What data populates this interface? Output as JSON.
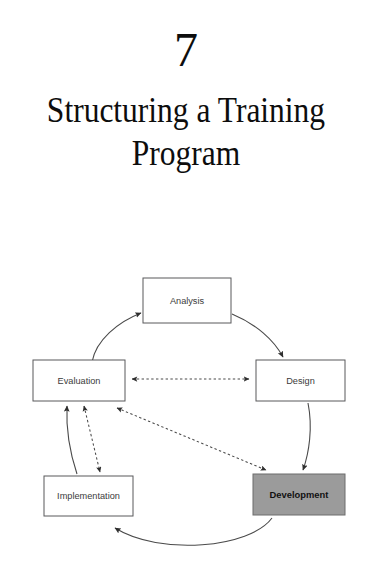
{
  "page": {
    "background_color": "#ffffff",
    "width": 372,
    "height": 566
  },
  "chapter": {
    "number": "7",
    "title": "Structuring a Training\nProgram",
    "title_line_1": "Structuring a Training",
    "title_line_2": "Program"
  },
  "diagram": {
    "name": "addie-training-cycle",
    "type": "cycle-diagram",
    "highlight_color": "#9b9b9b",
    "box_border_color": "#58595b",
    "line_color": "#4a4a4a",
    "nodes": [
      {
        "id": "analysis",
        "label": "Analysis",
        "highlighted": false,
        "x": 143,
        "y": 30,
        "w": 88,
        "h": 45
      },
      {
        "id": "design",
        "label": "Design",
        "highlighted": false,
        "x": 256,
        "y": 112,
        "w": 89,
        "h": 41
      },
      {
        "id": "development",
        "label": "Development",
        "highlighted": true,
        "x": 253,
        "y": 226,
        "w": 92,
        "h": 41
      },
      {
        "id": "implementation",
        "label": "Implementation",
        "highlighted": false,
        "x": 44,
        "y": 228,
        "w": 89,
        "h": 40
      },
      {
        "id": "evaluation",
        "label": "Evaluation",
        "highlighted": false,
        "x": 33,
        "y": 112,
        "w": 92,
        "h": 41
      }
    ],
    "connections": [
      {
        "from": "evaluation",
        "to": "analysis",
        "style": "solid-curve",
        "direction": "one-way"
      },
      {
        "from": "analysis",
        "to": "design",
        "style": "solid-curve",
        "direction": "one-way"
      },
      {
        "from": "design",
        "to": "development",
        "style": "solid-curve",
        "direction": "one-way"
      },
      {
        "from": "development",
        "to": "implementation",
        "style": "solid-curve",
        "direction": "one-way"
      },
      {
        "from": "implementation",
        "to": "evaluation",
        "style": "solid-curve",
        "direction": "one-way"
      },
      {
        "from": "evaluation",
        "to": "design",
        "style": "dashed",
        "direction": "two-way"
      },
      {
        "from": "evaluation",
        "to": "development",
        "style": "dashed-diagonal",
        "direction": "two-way"
      },
      {
        "from": "evaluation",
        "to": "implementation",
        "style": "dashed",
        "direction": "two-way"
      }
    ]
  }
}
